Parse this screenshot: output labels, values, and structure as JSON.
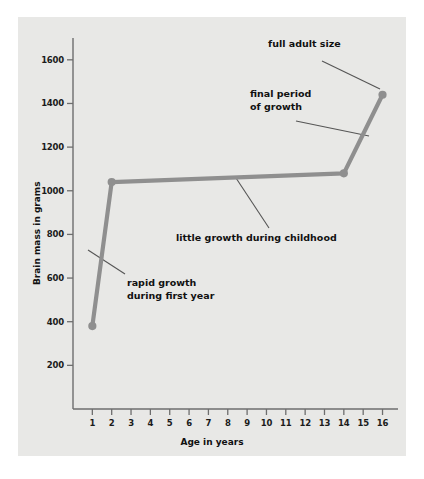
{
  "chart_data": {
    "type": "line",
    "title": "",
    "xlabel": "Age in years",
    "ylabel": "Brain mass in grams",
    "xlim": [
      0,
      16.8
    ],
    "ylim": [
      0,
      1700
    ],
    "grid": false,
    "legend": false,
    "x_ticks": [
      1,
      2,
      3,
      4,
      5,
      6,
      7,
      8,
      9,
      10,
      11,
      12,
      13,
      14,
      15,
      16
    ],
    "y_ticks": [
      200,
      400,
      600,
      800,
      1000,
      1200,
      1400,
      1600
    ],
    "series": [
      {
        "name": "Brain mass",
        "color": "#8f8f8f",
        "marker": "circle",
        "x": [
          1,
          2,
          14,
          16
        ],
        "values": [
          380,
          1040,
          1080,
          1440
        ]
      }
    ],
    "annotations": [
      {
        "id": "full-adult-size",
        "text": "full adult size",
        "lines": [
          "full adult size"
        ],
        "text_x": 268,
        "text_y": 38,
        "leader": {
          "x1": 322,
          "y1": 61,
          "x2": 380,
          "y2": 89
        }
      },
      {
        "id": "final-period-of-growth",
        "text": "final period of growth",
        "lines": [
          "final period",
          "of growth"
        ],
        "text_x": 250,
        "text_y": 88,
        "leader": {
          "x1": 296,
          "y1": 121,
          "x2": 369,
          "y2": 136
        }
      },
      {
        "id": "little-growth-during-childhood",
        "text": "little growth during childhood",
        "lines": [
          "little growth during childhood"
        ],
        "text_x": 176,
        "text_y": 232,
        "leader": {
          "x1": 236,
          "y1": 178,
          "x2": 269,
          "y2": 228
        }
      },
      {
        "id": "rapid-growth-during-first-year",
        "text": "rapid growth during first year",
        "lines": [
          "rapid growth",
          "during first year"
        ],
        "text_x": 127,
        "text_y": 277,
        "leader": {
          "x1": 88,
          "y1": 250,
          "x2": 125,
          "y2": 274
        }
      }
    ]
  },
  "colors": {
    "panel_background": "#e8e8e6",
    "figure_background": "#ffffff",
    "line": "#8f8f8f",
    "marker": "#8f8f8f",
    "axis": "#6e6e6e",
    "text": "#111111",
    "leader": "#555555"
  }
}
